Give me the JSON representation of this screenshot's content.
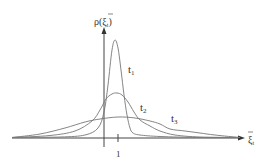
{
  "chart_data": {
    "type": "line",
    "title": "",
    "xlabel": "ξ̃_t",
    "ylabel": "ρ(ξ̃_t)",
    "x_ticks": [
      "1"
    ],
    "grid": false,
    "legend": "inline curve labels",
    "series": [
      {
        "name": "t1",
        "label": "t",
        "sub": "1",
        "description": "sharp narrow peak near x=1",
        "points": [
          [
            12,
            137.5
          ],
          [
            60,
            137
          ],
          [
            85,
            135
          ],
          [
            98,
            128
          ],
          [
            104,
            112
          ],
          [
            108,
            85
          ],
          [
            112,
            50
          ],
          [
            115,
            40
          ],
          [
            118,
            48
          ],
          [
            121,
            70
          ],
          [
            124,
            95
          ],
          [
            127,
            115
          ],
          [
            130,
            128
          ],
          [
            133,
            133
          ],
          [
            140,
            135
          ],
          [
            160,
            136.5
          ],
          [
            200,
            137.5
          ],
          [
            240,
            137.5
          ]
        ]
      },
      {
        "name": "t2",
        "label": "t",
        "sub": "2",
        "description": "medium peak near x=1",
        "points": [
          [
            12,
            137.5
          ],
          [
            50,
            135.5
          ],
          [
            75,
            131
          ],
          [
            92,
            121
          ],
          [
            100,
            110
          ],
          [
            106,
            99
          ],
          [
            112,
            94
          ],
          [
            117,
            93
          ],
          [
            122,
            95
          ],
          [
            128,
            102
          ],
          [
            134,
            112
          ],
          [
            140,
            120
          ],
          [
            150,
            126
          ],
          [
            160,
            131
          ],
          [
            175,
            135
          ],
          [
            200,
            137
          ],
          [
            240,
            137.5
          ]
        ]
      },
      {
        "name": "t3",
        "label": "t",
        "sub": "3",
        "description": "broad flat distribution",
        "points": [
          [
            12,
            137.5
          ],
          [
            40,
            134
          ],
          [
            65,
            128
          ],
          [
            85,
            122
          ],
          [
            100,
            119
          ],
          [
            118,
            117
          ],
          [
            135,
            118
          ],
          [
            150,
            121
          ],
          [
            160,
            124
          ],
          [
            170,
            129
          ],
          [
            185,
            131
          ],
          [
            200,
            133
          ],
          [
            215,
            135
          ],
          [
            240,
            137.5
          ]
        ]
      }
    ],
    "annotations": [
      {
        "text": "t",
        "sub": "1",
        "x": 128,
        "y": 73
      },
      {
        "text": "t",
        "sub": "2",
        "x": 140,
        "y": 111
      },
      {
        "text": "t",
        "sub": "3",
        "x": 171,
        "y": 122
      }
    ]
  },
  "labels": {
    "y_axis_main": "ρ(ξ",
    "y_axis_sub": "t",
    "y_axis_close": ")",
    "x_axis_main": "ξ",
    "x_axis_sub": "t",
    "tick_1": "1",
    "t1": "t",
    "t1_sub": "1",
    "t2": "t",
    "t2_sub": "2",
    "t3": "t",
    "t3_sub": "3"
  }
}
